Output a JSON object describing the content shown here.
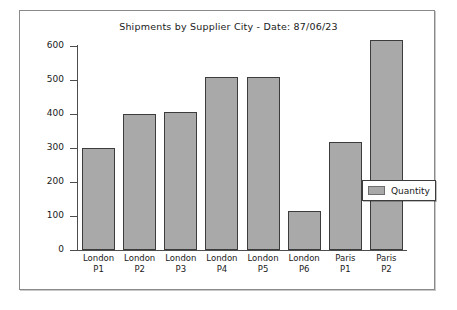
{
  "chart_data": {
    "type": "bar",
    "title": "Shipments by Supplier City - Date: 87/06/23",
    "xlabel": "",
    "ylabel": "",
    "categories": [
      "London P1",
      "London P2",
      "London P3",
      "London P4",
      "London P5",
      "London P6",
      "Paris P1",
      "Paris P2"
    ],
    "category_lines": [
      [
        "London",
        "P1"
      ],
      [
        "London",
        "P2"
      ],
      [
        "London",
        "P3"
      ],
      [
        "London",
        "P4"
      ],
      [
        "London",
        "P5"
      ],
      [
        "London",
        "P6"
      ],
      [
        "Paris",
        "P1"
      ],
      [
        "Paris",
        "P2"
      ]
    ],
    "series": [
      {
        "name": "Quantity",
        "values": [
          300,
          400,
          405,
          508,
          510,
          115,
          318,
          618
        ]
      }
    ],
    "ylim": [
      0,
      600
    ],
    "yticks": [
      0,
      100,
      200,
      300,
      400,
      500,
      600
    ],
    "ytick_labels": [
      "0",
      "100",
      "200",
      "300",
      "400",
      "500",
      "600"
    ],
    "grid": false,
    "legend": {
      "position": "center-right",
      "entries": [
        {
          "label": "Quantity",
          "color": "#a9a9a9"
        }
      ]
    },
    "colors": {
      "bar_fill": "#a9a9a9",
      "bar_edge": "#3c3c3c",
      "axis": "#4d4d4d",
      "text": "#1a1a1a",
      "background": "#ffffff",
      "panel_border": "#8a8a8a"
    }
  }
}
